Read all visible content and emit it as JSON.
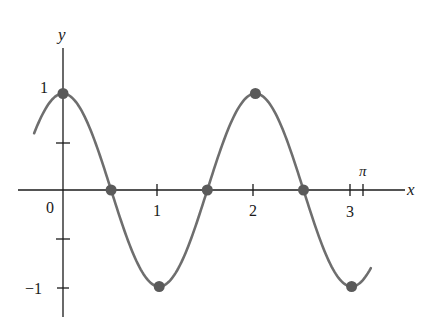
{
  "chart_data": {
    "type": "line",
    "title": "",
    "function": "y = cos(πx)",
    "xlabel": "x",
    "ylabel": "y",
    "xlim": [
      -0.3,
      3.2
    ],
    "ylim": [
      -1,
      1
    ],
    "grid": false,
    "legend": null,
    "x_ticks": [
      {
        "value": 1,
        "label": "1"
      },
      {
        "value": 2,
        "label": "2"
      },
      {
        "value": 3,
        "label": "3"
      },
      {
        "value": 3.14159,
        "label": "π"
      }
    ],
    "y_ticks": [
      {
        "value": 1,
        "label": "1"
      },
      {
        "value": 0.5,
        "label": ""
      },
      {
        "value": -0.5,
        "label": ""
      },
      {
        "value": -1,
        "label": "−1"
      }
    ],
    "origin_label": "0",
    "series": [
      {
        "name": "cos(πx)",
        "color": "#6e6e6e",
        "x": [
          -0.3,
          0,
          0.5,
          1,
          1.5,
          2,
          2.5,
          3,
          3.2
        ],
        "values": [
          0.588,
          1,
          0,
          -1,
          0,
          1,
          0,
          -1,
          -0.809
        ]
      }
    ],
    "marked_points": [
      {
        "x": 0,
        "y": 1
      },
      {
        "x": 0.5,
        "y": 0
      },
      {
        "x": 1,
        "y": -1
      },
      {
        "x": 1.5,
        "y": 0
      },
      {
        "x": 2,
        "y": 1
      },
      {
        "x": 2.5,
        "y": 0
      },
      {
        "x": 3,
        "y": -1
      }
    ]
  },
  "labels": {
    "x_axis": "x",
    "y_axis": "y",
    "origin": "0",
    "y_one": "1",
    "y_neg_one": "−1",
    "x_one": "1",
    "x_two": "2",
    "x_three": "3",
    "x_pi": "π"
  },
  "colors": {
    "curve": "#6e6e6e",
    "axis": "#1a1a1a",
    "point": "#5a5a5a"
  }
}
